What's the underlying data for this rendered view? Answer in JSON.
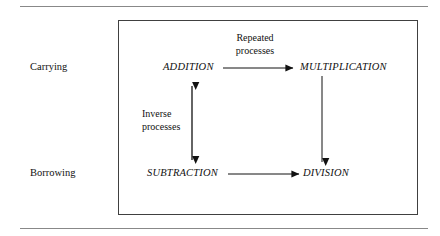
{
  "figure": {
    "type": "concept-diagram",
    "title": "",
    "row_labels": [
      {
        "id": "carrying",
        "text": "Carrying"
      },
      {
        "id": "borrowing",
        "text": "Borrowing"
      }
    ],
    "nodes": [
      {
        "id": "addition",
        "text": "ADDITION"
      },
      {
        "id": "multiplication",
        "text": "MULTIPLICATION"
      },
      {
        "id": "subtraction",
        "text": "SUBTRACTION"
      },
      {
        "id": "division",
        "text": "DIVISION"
      }
    ],
    "edge_labels": [
      {
        "id": "repeated",
        "line1": "Repeated",
        "line2": "processes"
      },
      {
        "id": "inverse",
        "line1": "Inverse",
        "line2": "processes"
      }
    ],
    "edges": [
      {
        "id": "addition-to-multiplication",
        "from": "addition",
        "to": "multiplication",
        "label": "repeated",
        "direction": "single",
        "orientation": "horizontal"
      },
      {
        "id": "multiplication-to-division",
        "from": "multiplication",
        "to": "division",
        "label": "",
        "direction": "single",
        "orientation": "vertical"
      },
      {
        "id": "addition-subtraction",
        "from": "addition",
        "to": "subtraction",
        "label": "inverse",
        "direction": "double",
        "orientation": "vertical"
      },
      {
        "id": "subtraction-to-division",
        "from": "subtraction",
        "to": "division",
        "label": "",
        "direction": "single",
        "orientation": "horizontal"
      }
    ],
    "colors": {
      "background": "#ffffff",
      "text": "#111111",
      "frame_border": "#404040",
      "rule": "#888888",
      "arrow": "#111111"
    }
  }
}
